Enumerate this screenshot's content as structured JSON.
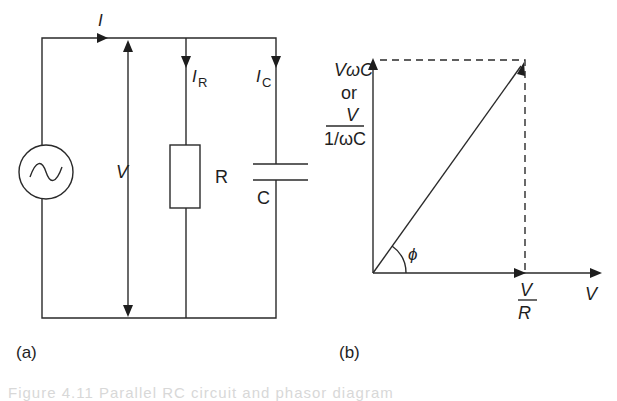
{
  "figure": {
    "caption": "Figure 4.11  Parallel RC circuit and phasor diagram",
    "panel_a": {
      "label": "(a)",
      "current_total": "I",
      "current_resistor": "I",
      "current_resistor_sub": "R",
      "current_capacitor": "I",
      "current_capacitor_sub": "C",
      "voltage": "V",
      "resistor": "R",
      "capacitor": "C",
      "source_icon": "ac-source-icon"
    },
    "panel_b": {
      "label": "(b)",
      "vertical_label_line1": "VωC",
      "vertical_label_or": "or",
      "vertical_label_num": "V",
      "vertical_label_den": "1/ωC",
      "horizontal_phasor_num": "V",
      "horizontal_phasor_den": "R",
      "reference_axis": "V",
      "angle": "ϕ"
    }
  },
  "colors": {
    "ink": "#1e1e1e",
    "background": "#ffffff"
  }
}
